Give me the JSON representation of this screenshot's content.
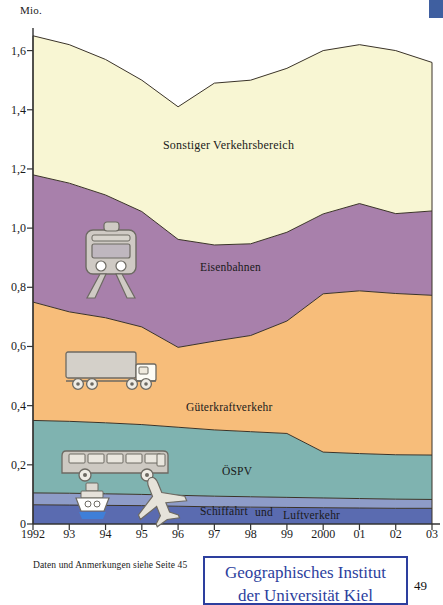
{
  "unit": "Mio.",
  "footnote": "Daten und Anmerkungen siehe Seite 45",
  "stamp": {
    "line1": "Geographisches Institut",
    "line2": "der Universität Kiel",
    "color": "#2d3f9e"
  },
  "page_number": "49",
  "icons": [
    {
      "name": "train-icon",
      "series": "Eisenbahnen"
    },
    {
      "name": "truck-icon",
      "series": "Güterkraftverkehr"
    },
    {
      "name": "bus-icon",
      "series": "ÖSPV"
    },
    {
      "name": "ship-icon",
      "series": "Schiffahrt"
    },
    {
      "name": "airplane-icon",
      "series": "Luftverkehr"
    }
  ],
  "chart_data": {
    "type": "area",
    "stacked": true,
    "title": "",
    "xlabel": "",
    "ylabel": "Mio.",
    "ylim": [
      0,
      1.7
    ],
    "grid": false,
    "legend": "inline-labels",
    "categories": [
      "1992",
      "93",
      "94",
      "95",
      "96",
      "97",
      "98",
      "99",
      "2000",
      "01",
      "02",
      "03"
    ],
    "x_tick_labels": [
      "1992",
      "93",
      "94",
      "95",
      "96",
      "97",
      "98",
      "99",
      "2000",
      "01",
      "02",
      "03"
    ],
    "y_tick_labels": [
      "0",
      "0,2",
      "0,4",
      "0,6",
      "0,8",
      "1,0",
      "1,2",
      "1,4",
      "1,6"
    ],
    "y_tick_values": [
      0,
      0.2,
      0.4,
      0.6,
      0.8,
      1.0,
      1.2,
      1.4,
      1.6
    ],
    "series": [
      {
        "name": "Luftverkehr",
        "label": "Luftverkehr",
        "color": "#5a6bb0",
        "values": [
          0.065,
          0.064,
          0.063,
          0.062,
          0.06,
          0.058,
          0.057,
          0.056,
          0.055,
          0.054,
          0.053,
          0.053
        ]
      },
      {
        "name": "Schiffahrt",
        "label": "Schiffahrt",
        "color": "#8e9cc8",
        "values": [
          0.04,
          0.04,
          0.039,
          0.038,
          0.037,
          0.036,
          0.035,
          0.034,
          0.033,
          0.032,
          0.031,
          0.03
        ]
      },
      {
        "name": "ÖSPV",
        "label": "ÖSPV",
        "color": "#7fb3b0",
        "values": [
          0.245,
          0.243,
          0.24,
          0.236,
          0.23,
          0.224,
          0.22,
          0.216,
          0.155,
          0.152,
          0.15,
          0.15
        ]
      },
      {
        "name": "Güterkraftverkehr",
        "label": "Güterkraftverkehr",
        "color": "#f7bd7a",
        "values": [
          0.4,
          0.37,
          0.355,
          0.33,
          0.27,
          0.3,
          0.325,
          0.38,
          0.535,
          0.55,
          0.545,
          0.54
        ]
      },
      {
        "name": "Eisenbahnen",
        "label": "Eisenbahnen",
        "color": "#a880ab",
        "values": [
          0.43,
          0.435,
          0.415,
          0.39,
          0.365,
          0.325,
          0.31,
          0.3,
          0.27,
          0.295,
          0.27,
          0.285
        ]
      },
      {
        "name": "Sonstiger Verkehrsbereich",
        "label": "Sonstiger Verkehrsbereich",
        "color": "#f8f6d3",
        "values": [
          0.47,
          0.468,
          0.458,
          0.444,
          0.448,
          0.547,
          0.553,
          0.554,
          0.552,
          0.537,
          0.551,
          0.502
        ]
      }
    ],
    "totals": [
      1.65,
      1.62,
      1.57,
      1.5,
      1.41,
      1.49,
      1.5,
      1.54,
      1.6,
      1.62,
      1.6,
      1.56
    ]
  }
}
